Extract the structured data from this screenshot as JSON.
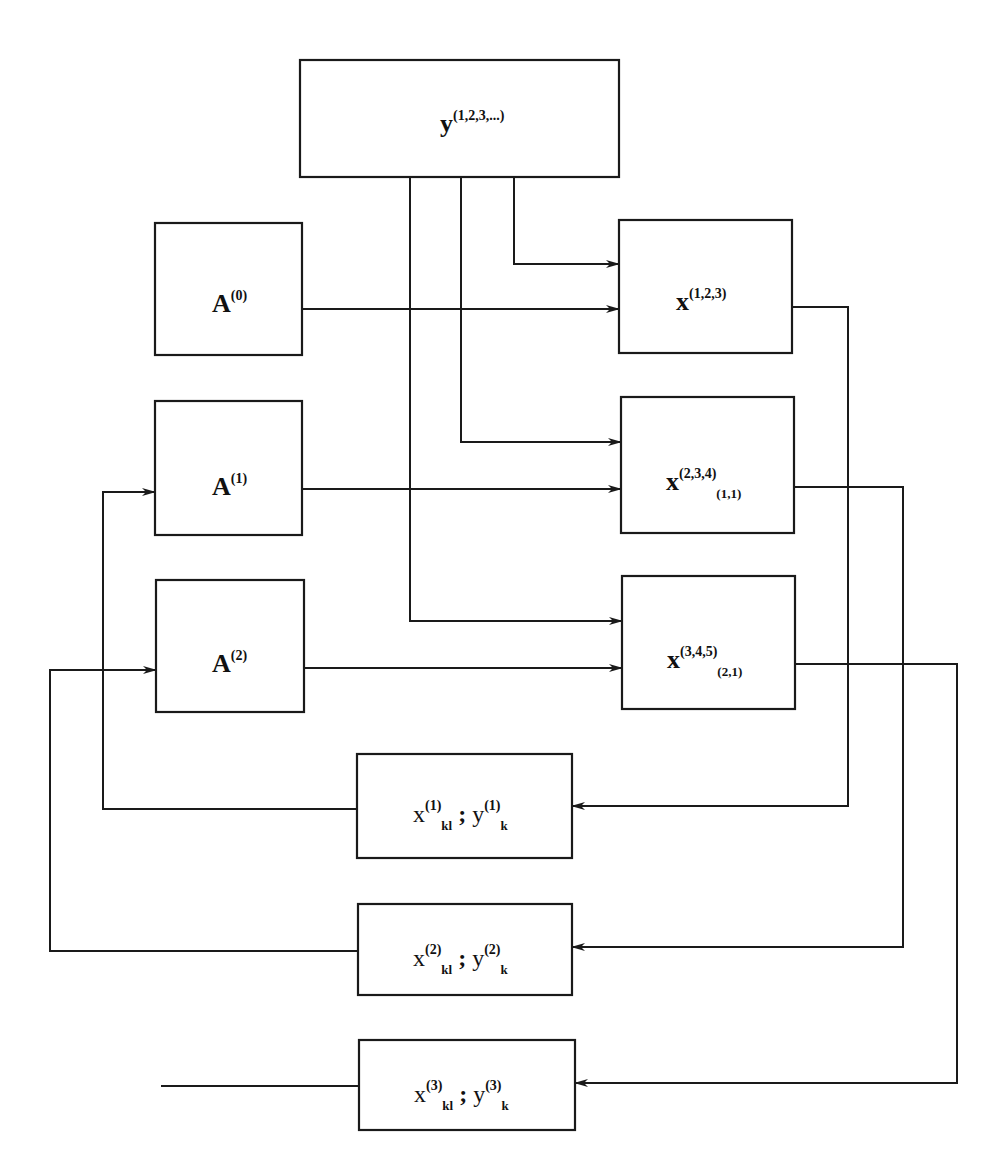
{
  "diagram": {
    "colors": {
      "stroke": "#1a1a1a",
      "background": "#ffffff",
      "text": "#111111"
    },
    "nodes": [
      {
        "id": "y_all",
        "base": "y",
        "sup": "(1,2,3,...)",
        "sub": "",
        "box": [
          300,
          60,
          319,
          117
        ],
        "label_xy": [
          440,
          132
        ],
        "bold": true
      },
      {
        "id": "A0",
        "base": "A",
        "sup": "(0)",
        "sub": "",
        "box": [
          155,
          223,
          147,
          132
        ],
        "label_xy": [
          212,
          312
        ],
        "bold": true
      },
      {
        "id": "A1",
        "base": "A",
        "sup": "(1)",
        "sub": "",
        "box": [
          155,
          401,
          147,
          134
        ],
        "label_xy": [
          212,
          495
        ],
        "bold": true
      },
      {
        "id": "A2",
        "base": "A",
        "sup": "(2)",
        "sub": "",
        "box": [
          156,
          580,
          148,
          132
        ],
        "label_xy": [
          212,
          672
        ],
        "bold": true
      },
      {
        "id": "x123",
        "base": "x",
        "sup": "(1,2,3)",
        "sub": "",
        "box": [
          619,
          220,
          173,
          133
        ],
        "label_xy": [
          676,
          310
        ],
        "bold": true
      },
      {
        "id": "x234",
        "base": "x",
        "sup": "(2,3,4)",
        "sub": "(1,1)",
        "box": [
          621,
          397,
          173,
          136
        ],
        "label_xy": [
          666,
          490
        ],
        "bold": true
      },
      {
        "id": "x345",
        "base": "x",
        "sup": "(3,4,5)",
        "sub": "(2,1)",
        "box": [
          622,
          576,
          173,
          133
        ],
        "label_xy": [
          667,
          668
        ],
        "bold": true
      },
      {
        "id": "r1",
        "base": "x",
        "sup": "(1)",
        "sub": "kl",
        "base2": "y",
        "sup2": "(1)",
        "sub2": "k",
        "sep": ";",
        "box": [
          357,
          754,
          215,
          104
        ],
        "label_xy": [
          413,
          822
        ],
        "bold": false
      },
      {
        "id": "r2",
        "base": "x",
        "sup": "(2)",
        "sub": "kl",
        "base2": "y",
        "sup2": "(2)",
        "sub2": "k",
        "sep": ";",
        "box": [
          358,
          904,
          214,
          91
        ],
        "label_xy": [
          413,
          966
        ],
        "bold": false
      },
      {
        "id": "r3",
        "base": "x",
        "sup": "(3)",
        "sub": "kl",
        "base2": "y",
        "sup2": "(3)",
        "sub2": "k",
        "sep": ";",
        "box": [
          359,
          1040,
          216,
          90
        ],
        "label_xy": [
          414,
          1102
        ],
        "bold": false
      }
    ],
    "edges": [
      {
        "from": "y_all",
        "to": "x123",
        "points": [
          [
            514,
            177
          ],
          [
            514,
            264
          ],
          [
            619,
            264
          ]
        ],
        "arrow": true
      },
      {
        "from": "y_all",
        "to": "x234",
        "points": [
          [
            461,
            177
          ],
          [
            461,
            442
          ],
          [
            621,
            442
          ]
        ],
        "arrow": true
      },
      {
        "from": "y_all",
        "to": "x345",
        "points": [
          [
            410,
            177
          ],
          [
            410,
            621
          ],
          [
            622,
            621
          ]
        ],
        "arrow": true
      },
      {
        "from": "A0",
        "to": "x123",
        "points": [
          [
            302,
            309
          ],
          [
            619,
            309
          ]
        ],
        "arrow": true
      },
      {
        "from": "A1",
        "to": "x234",
        "points": [
          [
            302,
            489
          ],
          [
            621,
            489
          ]
        ],
        "arrow": true
      },
      {
        "from": "A2",
        "to": "x345",
        "points": [
          [
            304,
            668
          ],
          [
            622,
            668
          ]
        ],
        "arrow": true
      },
      {
        "from": "x123",
        "to": "r1",
        "points": [
          [
            792,
            307
          ],
          [
            848,
            307
          ],
          [
            848,
            806
          ],
          [
            572,
            806
          ]
        ],
        "arrow": true
      },
      {
        "from": "x234",
        "to": "r2",
        "points": [
          [
            794,
            487
          ],
          [
            903,
            487
          ],
          [
            903,
            947
          ],
          [
            572,
            947
          ]
        ],
        "arrow": true
      },
      {
        "from": "x345",
        "to": "r3",
        "points": [
          [
            795,
            664
          ],
          [
            957,
            664
          ],
          [
            957,
            1083
          ],
          [
            575,
            1083
          ]
        ],
        "arrow": true
      },
      {
        "from": "r1",
        "to": "A1",
        "points": [
          [
            357,
            809
          ],
          [
            103,
            809
          ],
          [
            103,
            492
          ],
          [
            155,
            492
          ]
        ],
        "arrow": true
      },
      {
        "from": "r2",
        "to": "A2",
        "points": [
          [
            358,
            951
          ],
          [
            50,
            951
          ],
          [
            50,
            670
          ],
          [
            156,
            670
          ]
        ],
        "arrow": true
      },
      {
        "from": "r3",
        "to": "out",
        "points": [
          [
            359,
            1086
          ],
          [
            161,
            1086
          ]
        ],
        "arrow": false
      }
    ]
  }
}
